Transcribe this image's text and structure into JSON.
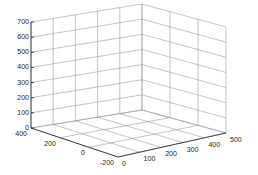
{
  "chart_data": {
    "type": "3d-axes",
    "title": "",
    "xlabel": "",
    "ylabel": "",
    "zlabel": "",
    "grid": true,
    "x_ticks": [
      "0",
      "100",
      "200",
      "300",
      "400",
      "500"
    ],
    "y_ticks": [
      "-200",
      "0",
      "200",
      "400"
    ],
    "z_ticks": [
      "0",
      "100",
      "200",
      "300",
      "400",
      "500",
      "600",
      "700"
    ],
    "xlim": [
      0,
      500
    ],
    "ylim": [
      -200,
      400
    ],
    "zlim": [
      0,
      700
    ],
    "series": [],
    "colors": {
      "grid": "#9a9a9a",
      "axis": "#222222",
      "background": "#ffffff"
    }
  }
}
